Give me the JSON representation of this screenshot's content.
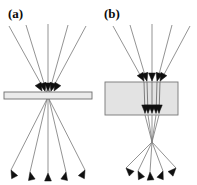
{
  "figure": {
    "kind": "ray-optics-diagram",
    "width": 197,
    "height": 185,
    "background_color": "#ffffff"
  },
  "panels": [
    {
      "id": "a",
      "label": "(a)",
      "label_x": 8,
      "label_y": 6,
      "slab": {
        "name": "thin-slab",
        "x": 4,
        "y": 92,
        "width": 88,
        "height": 7,
        "fill_color": "#ebebeb",
        "stroke_color": "#6e6e6e",
        "stroke_width": 0.9
      },
      "focus": {
        "x": 48,
        "y": 95
      },
      "incoming_rays": [
        {
          "x1": 9,
          "y1": 26,
          "x2": 46,
          "y2": 93
        },
        {
          "x1": 26,
          "y1": 25,
          "x2": 47,
          "y2": 93
        },
        {
          "x1": 48,
          "y1": 24,
          "x2": 48,
          "y2": 93
        },
        {
          "x1": 68,
          "y1": 25,
          "x2": 49,
          "y2": 93
        },
        {
          "x1": 86,
          "y1": 26,
          "x2": 50,
          "y2": 93
        }
      ],
      "incoming_arrow_tips": [
        {
          "x": 42,
          "y": 91,
          "angle": 61
        },
        {
          "x": 45,
          "y": 91,
          "angle": 73
        },
        {
          "x": 48,
          "y": 91,
          "angle": 90
        },
        {
          "x": 51,
          "y": 91,
          "angle": 107
        },
        {
          "x": 54,
          "y": 91,
          "angle": 119
        }
      ],
      "outgoing_rays": [
        {
          "x1": 47,
          "y1": 99,
          "x2": 11,
          "y2": 170
        },
        {
          "x1": 47,
          "y1": 99,
          "x2": 30,
          "y2": 172
        },
        {
          "x1": 48,
          "y1": 99,
          "x2": 48,
          "y2": 173
        },
        {
          "x1": 49,
          "y1": 99,
          "x2": 66,
          "y2": 172
        },
        {
          "x1": 49,
          "y1": 99,
          "x2": 85,
          "y2": 170
        }
      ],
      "outgoing_arrow_tips": [
        {
          "x": 11,
          "y": 170,
          "angle": 243
        },
        {
          "x": 30,
          "y": 172,
          "angle": 257
        },
        {
          "x": 48,
          "y": 173,
          "angle": 270
        },
        {
          "x": 66,
          "y": 172,
          "angle": 283
        },
        {
          "x": 85,
          "y": 170,
          "angle": 297
        }
      ]
    },
    {
      "id": "b",
      "label": "(b)",
      "label_x": 104,
      "label_y": 6,
      "slab": {
        "name": "thick-slab",
        "x": 105,
        "y": 82,
        "width": 73,
        "height": 33,
        "fill_color": "#e3e3e3",
        "stroke_color": "#777777",
        "stroke_width": 0.9
      },
      "internal_focus": {
        "x": 152,
        "y": 98
      },
      "external_focus": {
        "x": 152,
        "y": 142
      },
      "incoming_rays": [
        {
          "x1": 113,
          "y1": 26,
          "x2": 144,
          "y2": 82
        },
        {
          "x1": 130,
          "y1": 25,
          "x2": 147,
          "y2": 82
        },
        {
          "x1": 152,
          "y1": 24,
          "x2": 152,
          "y2": 82
        },
        {
          "x1": 172,
          "y1": 25,
          "x2": 157,
          "y2": 82
        },
        {
          "x1": 190,
          "y1": 26,
          "x2": 160,
          "y2": 82
        }
      ],
      "incoming_arrow_tips": [
        {
          "x": 144,
          "y": 81,
          "angle": 61
        },
        {
          "x": 147,
          "y": 81,
          "angle": 73
        },
        {
          "x": 152,
          "y": 81,
          "angle": 90
        },
        {
          "x": 157,
          "y": 81,
          "angle": 107
        },
        {
          "x": 160,
          "y": 81,
          "angle": 119
        }
      ],
      "internal_rays": [
        {
          "x1": 144,
          "y1": 82,
          "x2": 145,
          "y2": 114
        },
        {
          "x1": 147,
          "y1": 82,
          "x2": 148,
          "y2": 114
        },
        {
          "x1": 152,
          "y1": 82,
          "x2": 152,
          "y2": 114
        },
        {
          "x1": 157,
          "y1": 82,
          "x2": 156,
          "y2": 114
        },
        {
          "x1": 160,
          "y1": 82,
          "x2": 159,
          "y2": 114
        }
      ],
      "exit_arrow_tips": [
        {
          "x": 145,
          "y": 113,
          "angle": 91
        },
        {
          "x": 148,
          "y": 113,
          "angle": 91
        },
        {
          "x": 152,
          "y": 113,
          "angle": 90
        },
        {
          "x": 156,
          "y": 113,
          "angle": 89
        },
        {
          "x": 159,
          "y": 113,
          "angle": 89
        }
      ],
      "converging_rays": [
        {
          "x1": 145,
          "y1": 115,
          "x2": 152,
          "y2": 142
        },
        {
          "x1": 148,
          "y1": 115,
          "x2": 152,
          "y2": 142
        },
        {
          "x1": 152,
          "y1": 115,
          "x2": 152,
          "y2": 142
        },
        {
          "x1": 156,
          "y1": 115,
          "x2": 152,
          "y2": 142
        },
        {
          "x1": 159,
          "y1": 115,
          "x2": 152,
          "y2": 142
        }
      ],
      "diverging_rays": [
        {
          "x1": 152,
          "y1": 142,
          "x2": 126,
          "y2": 168
        },
        {
          "x1": 152,
          "y1": 142,
          "x2": 138,
          "y2": 171
        },
        {
          "x1": 152,
          "y1": 142,
          "x2": 150,
          "y2": 172
        },
        {
          "x1": 152,
          "y1": 142,
          "x2": 163,
          "y2": 171
        },
        {
          "x1": 152,
          "y1": 142,
          "x2": 176,
          "y2": 168
        }
      ],
      "diverging_arrow_tips": [
        {
          "x": 126,
          "y": 168,
          "angle": 225
        },
        {
          "x": 138,
          "y": 171,
          "angle": 244
        },
        {
          "x": 150,
          "y": 172,
          "angle": 266
        },
        {
          "x": 163,
          "y": 171,
          "angle": 291
        },
        {
          "x": 176,
          "y": 168,
          "angle": 313
        }
      ]
    }
  ],
  "style": {
    "ray_color": "#808080",
    "ray_width": 0.85,
    "inner_ray_color": "#6a6a6a",
    "arrow_color": "#101010",
    "arrow_length": 8,
    "arrow_half_width": 3.4,
    "label_color": "#0b0b0b"
  }
}
